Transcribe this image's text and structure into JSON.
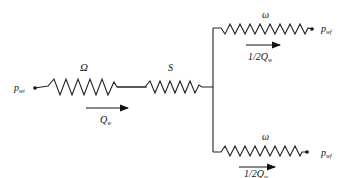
{
  "diagram": {
    "type": "resistor-network",
    "inlet": {
      "label": "p",
      "subscript": "wi"
    },
    "outlet_top": {
      "label": "p",
      "subscript": "wf"
    },
    "outlet_bottom": {
      "label": "p",
      "subscript": "wf"
    },
    "resistors": {
      "main_1": {
        "label": "Ω"
      },
      "main_2": {
        "label": "S"
      },
      "branch_top": {
        "label": "ω"
      },
      "branch_bottom": {
        "label": "ω"
      }
    },
    "flows": {
      "main": {
        "label": "Q",
        "subscript": "w"
      },
      "top": {
        "prefix": "1/2",
        "label": "Q",
        "subscript": "w"
      },
      "bottom": {
        "prefix": "1/2",
        "label": "Q",
        "subscript": "w"
      }
    }
  }
}
